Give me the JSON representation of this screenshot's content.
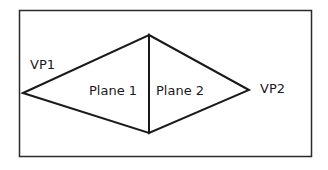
{
  "diagram": {
    "labels": {
      "vp1": "VP1",
      "vp2": "VP2",
      "plane1": "Plane 1",
      "plane2": "Plane 2"
    },
    "colors": {
      "stroke": "#1a1a1a",
      "background": "#ffffff"
    }
  }
}
